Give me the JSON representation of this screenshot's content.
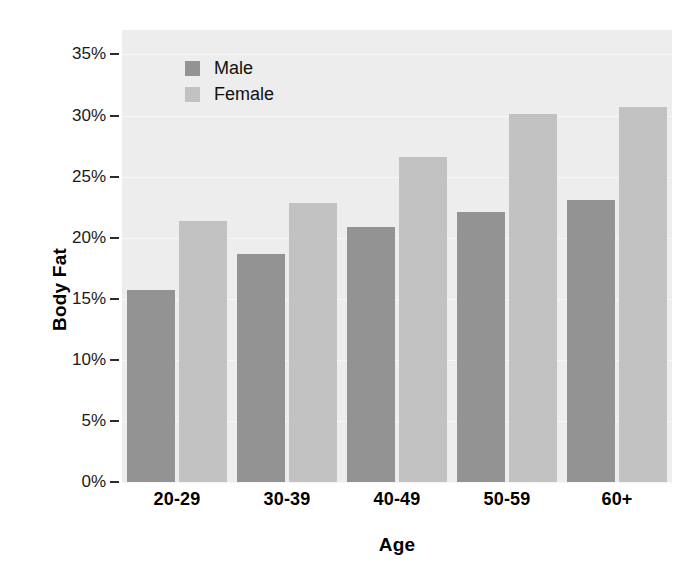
{
  "chart_data": {
    "type": "bar",
    "title": "",
    "xlabel": "Age",
    "ylabel": "Body Fat",
    "categories": [
      "20-29",
      "30-39",
      "40-49",
      "50-59",
      "60+"
    ],
    "series": [
      {
        "name": "Male",
        "color": "#939393",
        "values": [
          15.7,
          18.7,
          20.9,
          22.1,
          23.1
        ]
      },
      {
        "name": "Female",
        "color": "#c2c2c2",
        "values": [
          21.4,
          22.8,
          26.6,
          30.1,
          30.7
        ]
      }
    ],
    "ylim": [
      0,
      37
    ],
    "yticks": [
      0,
      5,
      10,
      15,
      20,
      25,
      30,
      35
    ],
    "ytick_labels": [
      "0%",
      "5%",
      "10%",
      "15%",
      "20%",
      "25%",
      "30%",
      "35%"
    ],
    "grid": true,
    "legend_position": "top-left",
    "plot_background": "#ededed",
    "figure_background": "#ffffff"
  }
}
